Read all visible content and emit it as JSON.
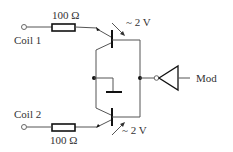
{
  "diagram": {
    "type": "circuit schematic",
    "inputs": [
      {
        "label": "Coil 1",
        "resistor": "100 Ω",
        "phototransistor_voltage": "~ 2 V"
      },
      {
        "label": "Coil 2",
        "resistor": "100 Ω",
        "phototransistor_voltage": "~ 2 V"
      }
    ],
    "output": {
      "label": "Mod"
    },
    "colors": {
      "wire": "#555555",
      "component": "#111111",
      "text": "#333333"
    }
  },
  "labels": {
    "coil1": "Coil 1",
    "coil2": "Coil 2",
    "r1": "100 Ω",
    "r2": "100 Ω",
    "v1": "~ 2 V",
    "v2": "~ 2 V",
    "out": "Mod"
  }
}
